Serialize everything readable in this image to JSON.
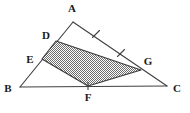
{
  "figure": {
    "width": 190,
    "height": 113,
    "background_color": "#ffffff",
    "line_color": "#404040",
    "label_color": "#1a1a1a",
    "shade_color": "#8a8a8a",
    "shade_style": "checkerboard-halftone-gray"
  },
  "labels": {
    "A": "A",
    "B": "B",
    "C": "C",
    "D": "D",
    "E": "E",
    "F": "F",
    "G": "G"
  },
  "points": {
    "A": {
      "x": 73,
      "y": 22,
      "label": "A",
      "label_x": 72,
      "label_y": 12
    },
    "B": {
      "x": 20,
      "y": 87,
      "label": "B",
      "label_x": 8,
      "label_y": 92
    },
    "C": {
      "x": 167,
      "y": 86,
      "label": "C",
      "label_x": 177,
      "label_y": 92
    },
    "D": {
      "x": 56,
      "y": 41,
      "label": "D",
      "label_x": 46,
      "label_y": 39
    },
    "E": {
      "x": 42,
      "y": 59,
      "label": "E",
      "label_x": 30,
      "label_y": 63
    },
    "F": {
      "x": 88,
      "y": 86,
      "label": "F",
      "label_x": 88,
      "label_y": 101
    },
    "G": {
      "x": 141,
      "y": 70,
      "label": "G",
      "label_x": 148,
      "label_y": 65
    }
  },
  "segments": [
    {
      "name": "AB",
      "from": "A",
      "to": "B"
    },
    {
      "name": "AC",
      "from": "A",
      "to": "C"
    },
    {
      "name": "BC",
      "from": "B",
      "to": "C"
    }
  ],
  "shaded_polygon": {
    "name": "DGFE",
    "vertices": [
      "D",
      "G",
      "F",
      "E"
    ],
    "fill": "#8a8a8a"
  },
  "tick_marks": [
    {
      "name": "tick-AG",
      "on_segment": "AC",
      "x": 96,
      "y": 34,
      "count": 1
    },
    {
      "name": "tick-GC",
      "on_segment": "AC",
      "x": 121,
      "y": 53,
      "count": 1
    },
    {
      "name": "tick-F",
      "on_segment": "BC",
      "x": 88,
      "y": 86,
      "count": 1
    }
  ]
}
